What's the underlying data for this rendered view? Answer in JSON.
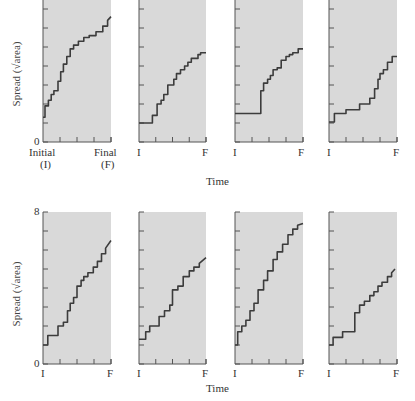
{
  "chart_data": {
    "type": "line",
    "ylabel": "Spread (√area)",
    "xlabel": "Time",
    "ylim": [
      0,
      8
    ],
    "y_ticks": [
      0,
      1,
      2,
      3,
      4,
      5,
      6,
      7,
      8
    ],
    "x_tick_labels_first_panel": [
      "Initial",
      "(I)",
      "Final",
      "(F)"
    ],
    "x_tick_labels": [
      "I",
      "F"
    ],
    "rows": [
      {
        "row": "top",
        "y_tick_labels_shown": [
          "0"
        ],
        "panels": [
          {
            "x": [
              0,
              0.03,
              0.03,
              0.08,
              0.08,
              0.12,
              0.12,
              0.16,
              0.16,
              0.22,
              0.22,
              0.26,
              0.26,
              0.3,
              0.3,
              0.35,
              0.35,
              0.4,
              0.4,
              0.45,
              0.45,
              0.52,
              0.52,
              0.6,
              0.6,
              0.68,
              0.68,
              0.78,
              0.78,
              0.88,
              0.88,
              0.95,
              0.95,
              1.0
            ],
            "y": [
              1.3,
              1.3,
              1.9,
              1.9,
              2.2,
              2.2,
              2.5,
              2.5,
              2.7,
              2.7,
              3.2,
              3.2,
              3.7,
              3.7,
              4.1,
              4.1,
              4.5,
              4.5,
              4.9,
              4.9,
              5.1,
              5.1,
              5.3,
              5.3,
              5.5,
              5.5,
              5.6,
              5.6,
              5.8,
              5.8,
              6.1,
              6.1,
              6.4,
              6.6
            ]
          },
          {
            "x": [
              0,
              0.2,
              0.2,
              0.27,
              0.27,
              0.33,
              0.33,
              0.37,
              0.37,
              0.43,
              0.43,
              0.52,
              0.52,
              0.56,
              0.56,
              0.62,
              0.62,
              0.68,
              0.68,
              0.73,
              0.73,
              0.78,
              0.78,
              0.88,
              0.88,
              0.92,
              0.92,
              1.0
            ],
            "y": [
              1.0,
              1.0,
              1.4,
              1.4,
              2.0,
              2.0,
              2.2,
              2.2,
              2.5,
              2.5,
              3.0,
              3.0,
              3.3,
              3.3,
              3.6,
              3.6,
              3.8,
              3.8,
              4.0,
              4.0,
              4.2,
              4.2,
              4.4,
              4.4,
              4.6,
              4.6,
              4.7,
              4.7
            ]
          },
          {
            "x": [
              0,
              0.38,
              0.38,
              0.42,
              0.42,
              0.48,
              0.48,
              0.52,
              0.52,
              0.56,
              0.56,
              0.62,
              0.62,
              0.68,
              0.68,
              0.75,
              0.75,
              0.8,
              0.8,
              0.85,
              0.85,
              0.93,
              0.93,
              1.0
            ],
            "y": [
              1.5,
              1.5,
              2.7,
              2.7,
              3.1,
              3.1,
              3.3,
              3.3,
              3.5,
              3.5,
              3.8,
              3.8,
              3.9,
              3.9,
              4.3,
              4.3,
              4.5,
              4.5,
              4.6,
              4.6,
              4.7,
              4.7,
              4.9,
              4.9
            ]
          },
          {
            "x": [
              0,
              0.08,
              0.08,
              0.25,
              0.25,
              0.45,
              0.45,
              0.6,
              0.6,
              0.67,
              0.67,
              0.72,
              0.72,
              0.75,
              0.75,
              0.8,
              0.8,
              0.86,
              0.86,
              0.93,
              0.93,
              1.0
            ],
            "y": [
              1.05,
              1.05,
              1.5,
              1.5,
              1.7,
              1.7,
              2.0,
              2.0,
              2.3,
              2.3,
              2.8,
              2.8,
              3.3,
              3.3,
              3.6,
              3.6,
              3.8,
              3.8,
              4.2,
              4.2,
              4.5,
              4.5
            ]
          }
        ]
      },
      {
        "row": "bottom",
        "y_tick_labels_shown": [
          "0",
          "8"
        ],
        "panels": [
          {
            "x": [
              0,
              0.07,
              0.07,
              0.22,
              0.22,
              0.3,
              0.3,
              0.36,
              0.36,
              0.4,
              0.4,
              0.45,
              0.45,
              0.5,
              0.5,
              0.56,
              0.56,
              0.6,
              0.6,
              0.66,
              0.66,
              0.74,
              0.74,
              0.8,
              0.8,
              0.86,
              0.86,
              0.92,
              0.92,
              1.0
            ],
            "y": [
              1.0,
              1.0,
              1.5,
              1.5,
              2.0,
              2.0,
              2.2,
              2.2,
              2.8,
              2.8,
              3.2,
              3.2,
              3.5,
              3.5,
              4.1,
              4.1,
              4.4,
              4.4,
              4.6,
              4.6,
              4.8,
              4.8,
              5.1,
              5.1,
              5.4,
              5.4,
              5.8,
              5.8,
              6.1,
              6.5
            ]
          },
          {
            "x": [
              0,
              0.1,
              0.1,
              0.16,
              0.16,
              0.3,
              0.3,
              0.38,
              0.38,
              0.46,
              0.46,
              0.5,
              0.5,
              0.58,
              0.58,
              0.66,
              0.66,
              0.75,
              0.75,
              0.82,
              0.82,
              0.9,
              0.9,
              1.0
            ],
            "y": [
              1.3,
              1.3,
              1.7,
              1.7,
              2.0,
              2.0,
              2.5,
              2.5,
              2.8,
              2.8,
              3.1,
              3.1,
              3.9,
              3.9,
              4.1,
              4.1,
              4.6,
              4.6,
              4.9,
              4.9,
              5.1,
              5.1,
              5.3,
              5.6
            ]
          },
          {
            "x": [
              0,
              0.04,
              0.04,
              0.1,
              0.1,
              0.16,
              0.16,
              0.22,
              0.22,
              0.28,
              0.28,
              0.34,
              0.34,
              0.42,
              0.42,
              0.48,
              0.48,
              0.56,
              0.56,
              0.62,
              0.62,
              0.7,
              0.7,
              0.78,
              0.78,
              0.85,
              0.85,
              0.92,
              0.92,
              1.0
            ],
            "y": [
              1.0,
              1.0,
              1.7,
              1.7,
              2.0,
              2.0,
              2.3,
              2.3,
              2.8,
              2.8,
              3.2,
              3.2,
              3.9,
              3.9,
              4.4,
              4.4,
              4.9,
              4.9,
              5.5,
              5.5,
              5.9,
              5.9,
              6.3,
              6.3,
              6.8,
              6.8,
              7.1,
              7.1,
              7.3,
              7.4
            ]
          },
          {
            "x": [
              0,
              0.06,
              0.06,
              0.2,
              0.2,
              0.38,
              0.38,
              0.45,
              0.45,
              0.52,
              0.52,
              0.6,
              0.6,
              0.66,
              0.66,
              0.72,
              0.72,
              0.78,
              0.78,
              0.86,
              0.86,
              0.92,
              0.92,
              0.97
            ],
            "y": [
              1.0,
              1.0,
              1.4,
              1.4,
              1.7,
              1.7,
              2.7,
              2.7,
              3.1,
              3.1,
              3.3,
              3.3,
              3.6,
              3.6,
              3.8,
              3.8,
              4.1,
              4.1,
              4.3,
              4.3,
              4.6,
              4.6,
              4.8,
              5.0
            ]
          }
        ]
      }
    ],
    "grid": false,
    "panel_background": "#d9d9d9",
    "line_color": "#3c3c3c"
  },
  "labels": {
    "ylabel_top": "Spread (√area)",
    "ylabel_bottom": "Spread (√area)",
    "xlabel_top": "Time",
    "xlabel_bottom": "Time",
    "zero": "0",
    "eight": "8",
    "initial": "Initial",
    "initial_abbr": "(I)",
    "final": "Final",
    "final_abbr": "(F)",
    "i": "I",
    "f": "F"
  }
}
